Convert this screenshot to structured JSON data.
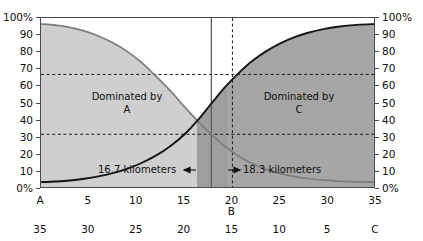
{
  "chart_data": {
    "type": "line",
    "title": "",
    "subtitle": "",
    "xlabel": "",
    "ylabel": "",
    "ylim": [
      0,
      100
    ],
    "xlim": [
      0,
      35
    ],
    "grid": false,
    "legend_position": "none",
    "y_tick_labels": [
      "100%",
      "90",
      "80",
      "70",
      "60",
      "50",
      "40",
      "30",
      "20",
      "10",
      "0%"
    ],
    "y_tick_values": [
      100,
      90,
      80,
      70,
      60,
      50,
      40,
      30,
      20,
      10,
      0
    ],
    "y_axis_right_tick_labels": [
      "100%",
      "90",
      "80",
      "70",
      "60",
      "50",
      "40",
      "30",
      "20",
      "10",
      "0%"
    ],
    "x_axis_top_row_labels": [
      "A",
      "5",
      "10",
      "15",
      "20",
      "25",
      "30",
      "35"
    ],
    "x_axis_top_row_values": [
      0,
      5,
      10,
      15,
      20,
      25,
      30,
      35
    ],
    "x_axis_bottom_row_labels": [
      "35",
      "30",
      "25",
      "20",
      "15",
      "10",
      "5",
      "C"
    ],
    "x_axis_bottom_row_values": [
      35,
      30,
      25,
      20,
      15,
      10,
      5,
      0
    ],
    "b_marker_label": "B",
    "b_marker_x": 20,
    "series": [
      {
        "name": "Dominated by A",
        "values": [
          96.5,
          95.8,
          94.5,
          92.5,
          89.5,
          85.5,
          80.5,
          74.0,
          66.0,
          57.5,
          48.0,
          39.0,
          32.0,
          25.0,
          19.5,
          15.0,
          11.5,
          9.0,
          7.2,
          6.0,
          5.2,
          4.6,
          4.2,
          4.0
        ],
        "x": [
          0,
          1.5,
          3,
          4.5,
          6,
          7.5,
          9,
          10.5,
          12,
          13.5,
          15,
          16.5,
          17.8,
          19.2,
          20.6,
          22,
          23.5,
          25,
          26.5,
          28,
          29.5,
          31,
          33,
          35
        ]
      },
      {
        "name": "Dominated by C",
        "values": [
          4.0,
          4.4,
          5.0,
          6.0,
          7.4,
          9.3,
          11.8,
          15.2,
          19.5,
          25.0,
          32.0,
          41.0,
          50.0,
          59.5,
          67.5,
          74.5,
          80.5,
          85.2,
          88.8,
          91.5,
          93.5,
          94.9,
          96.0,
          96.5
        ],
        "x": [
          0,
          1.5,
          3,
          4.5,
          6,
          7.5,
          9,
          10.5,
          12,
          13.5,
          15,
          16.5,
          17.8,
          19.2,
          20.6,
          22,
          23.5,
          25,
          26.5,
          28,
          29.5,
          31,
          33,
          35
        ]
      }
    ],
    "crossover_x": 17.8,
    "crossover_y": 50,
    "reference_lines": [
      {
        "name": "lower-dashed-horizontal",
        "orientation": "horizontal",
        "value": 32,
        "style": "dashed"
      },
      {
        "name": "upper-dashed-horizontal",
        "orientation": "horizontal",
        "value": 67,
        "style": "dashed"
      },
      {
        "name": "crossover-vertical",
        "orientation": "vertical",
        "value": 17.8,
        "style": "solid"
      },
      {
        "name": "b-vertical",
        "orientation": "vertical",
        "value": 20,
        "style": "dashed"
      }
    ],
    "annotations": [
      {
        "name": "region-a",
        "text_line1": "Dominated by",
        "text_line2": "A",
        "x": 9,
        "y": 47
      },
      {
        "name": "region-c",
        "text_line1": "Dominated by",
        "text_line2": "C",
        "x": 27,
        "y": 47
      },
      {
        "name": "distance-left",
        "text": "16.7 kilometers",
        "arrow": "left"
      },
      {
        "name": "distance-right",
        "text": "18.3 kilometers",
        "arrow": "right"
      }
    ],
    "colors": {
      "area_light": "#cfcfcf",
      "area_mid": "#b3b3b3",
      "area_dark": "#9a9a9a",
      "curve_a": "#7a7a7a",
      "curve_c": "#1a1a1a",
      "axis": "#4a4a4a",
      "text": "#111111",
      "background": "#ffffff"
    }
  }
}
